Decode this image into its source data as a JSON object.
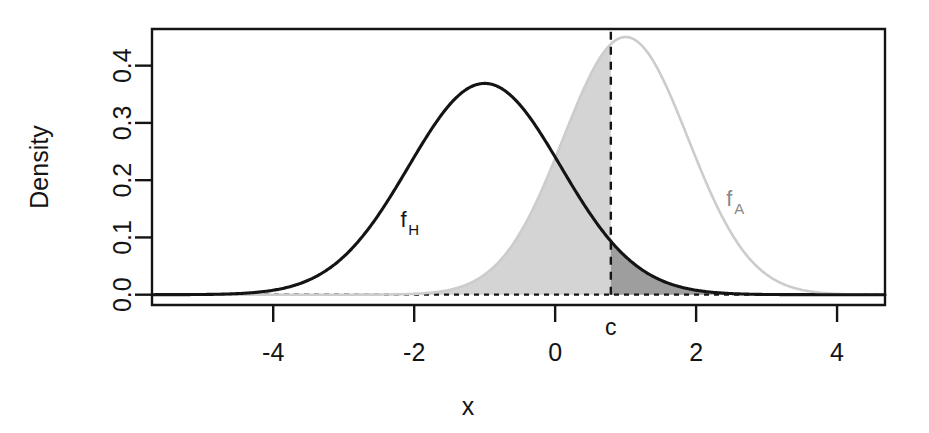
{
  "figure": {
    "background": "#ffffff",
    "plot_box": {
      "left": 152,
      "top": 29,
      "right": 885,
      "bottom": 305
    }
  },
  "chart_data": {
    "type": "line",
    "title": "",
    "subtitle": "",
    "xlabel": "x",
    "ylabel": "Density",
    "xlim": [
      -5.72,
      4.68
    ],
    "ylim": [
      -0.018,
      0.464
    ],
    "xticks": [
      -4,
      -2,
      0,
      2,
      4
    ],
    "xtick_labels": [
      "-4",
      "-2",
      "0",
      "2",
      "4"
    ],
    "yticks": [
      0.0,
      0.1,
      0.2,
      0.3,
      0.4
    ],
    "ytick_labels": [
      "0.0",
      "0.1",
      "0.2",
      "0.3",
      "0.4"
    ],
    "grid": false,
    "legend": "inline-annotations",
    "series": [
      {
        "name": "f_H",
        "label": "f",
        "label_sub": "H",
        "distribution": "normal",
        "mean": -1.0,
        "sd": 1.08,
        "peak_density": 0.369,
        "color": "#141414",
        "line_width": 3.1,
        "label_x": -2.15,
        "label_y": 0.118
      },
      {
        "name": "f_A",
        "label": "f",
        "label_sub": "A",
        "distribution": "normal",
        "mean": 1.0,
        "sd": 0.886,
        "peak_density": 0.45,
        "color": "#cccccc",
        "line_width": 2.6,
        "label_x": 2.47,
        "label_y": 0.155
      }
    ],
    "annotations": [
      {
        "name": "critical-value",
        "label": "c",
        "x": 0.79,
        "style": "vertical dashed line from y=0 to top of plot"
      },
      {
        "name": "zero-baseline",
        "label": "",
        "y": 0.0,
        "style": "horizontal dashed line across plot"
      }
    ],
    "shaded_regions": [
      {
        "name": "type-ii-error-region",
        "description": "area under f_A to the left of c",
        "fill": "#d4d4d4",
        "x_from": -5.72,
        "x_to": 0.79,
        "curve": "f_A"
      },
      {
        "name": "type-i-error-region",
        "description": "area under f_H to the right of c",
        "fill": "#9e9e9e",
        "x_from": 0.79,
        "x_to": 4.68,
        "curve": "f_H"
      }
    ]
  },
  "labels": {
    "y_axis_title": "Density",
    "x_axis_title": "x",
    "critical_value": "c",
    "curve_h_base": "f",
    "curve_h_sub": "H",
    "curve_a_base": "f",
    "curve_a_sub": "A",
    "xtick_0": "-4",
    "xtick_1": "-2",
    "xtick_2": "0",
    "xtick_3": "2",
    "xtick_4": "4",
    "ytick_0": "0.0",
    "ytick_1": "0.1",
    "ytick_2": "0.2",
    "ytick_3": "0.3",
    "ytick_4": "0.4"
  }
}
